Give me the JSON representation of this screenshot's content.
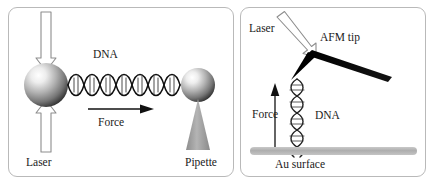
{
  "figure": {
    "background_color": "#ffffff",
    "panel_border_color": "#b9b9b9"
  },
  "panels": [
    {
      "id": "optical-tweezers",
      "name": "Optical tweezers panel",
      "labels": {
        "dna": "DNA",
        "force": "Force",
        "laser": "Laser",
        "pipette": "Pipette"
      },
      "elements": {
        "trapped_bead": "sphere",
        "held_bead": "sphere",
        "dna_molecule": "double-helix",
        "laser_arrow_down": "hollow-arrow-down",
        "laser_arrow_up": "hollow-arrow-up",
        "force_arrow": "arrow-right",
        "pipette": "cone"
      },
      "colors": {
        "bead_light": "#f2f2f2",
        "bead_mid": "#9a9a9a",
        "bead_dark": "#3a3a3a",
        "pipette_fill": "#9e9e9e",
        "arrow_outline": "#7a7a7a",
        "dna_stroke": "#111111"
      }
    },
    {
      "id": "atomic-force-microscopy",
      "name": "AFM panel",
      "labels": {
        "laser": "Laser",
        "afm_tip": "AFM tip",
        "force": "Force",
        "dna": "DNA",
        "au_surface": "Au surface"
      },
      "elements": {
        "cantilever": "black-beam",
        "tip": "black-triangle",
        "dna_molecule": "double-helix-vertical",
        "laser_arrow": "hollow-arrow-diagonal",
        "force_arrow": "arrow-up",
        "gold_surface": "gray-bar"
      },
      "colors": {
        "cantilever_fill": "#000000",
        "surface_fill": "#b3b3b3",
        "arrow_outline": "#7a7a7a",
        "dna_stroke": "#222222"
      }
    }
  ]
}
